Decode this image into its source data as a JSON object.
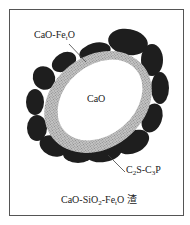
{
  "diagram": {
    "labels": {
      "shell": "CaO-Fe",
      "shell_sub": "t",
      "shell_tail": "O",
      "core": "CaO",
      "particles_a": "C",
      "particles_a_sub": "2",
      "particles_b": "S-C",
      "particles_b_sub": "3",
      "particles_c": "P",
      "caption_a": "CaO-SiO",
      "caption_a_sub": "2",
      "caption_b": "-Fe",
      "caption_b_sub": "t",
      "caption_c": "O 渣"
    },
    "colors": {
      "frame": "#555555",
      "core": "#ffffff",
      "shell": "#b0b0b0",
      "particles": "#1e1e1e",
      "text": "#222222"
    }
  }
}
